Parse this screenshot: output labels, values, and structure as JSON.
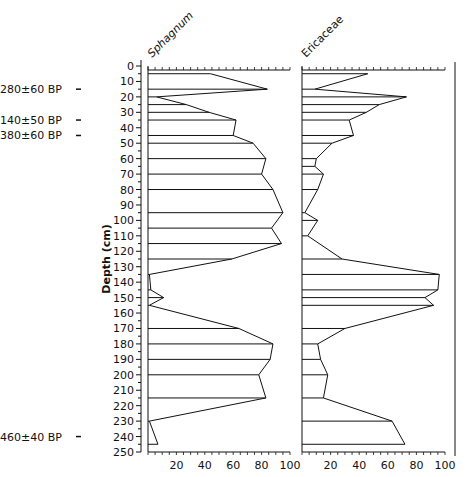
{
  "chart_data": {
    "type": "area",
    "subtype": "pollen-stratigraphic-diagram",
    "ylabel": "Depth (cm)",
    "ylim": [
      0,
      250
    ],
    "yticks": [
      0,
      10,
      20,
      30,
      40,
      50,
      60,
      70,
      80,
      90,
      100,
      110,
      120,
      130,
      140,
      150,
      160,
      170,
      180,
      190,
      200,
      210,
      220,
      230,
      240,
      250
    ],
    "xticks": [
      20,
      40,
      60,
      80,
      100
    ],
    "xlim": [
      0,
      100
    ],
    "dates": [
      {
        "label": "280±60 BP",
        "depth": 15
      },
      {
        "label": "2140±50 BP",
        "depth": 35
      },
      {
        "label": "2380±60 BP",
        "depth": 45
      },
      {
        "label": "4460±40 BP",
        "depth": 240
      }
    ],
    "series": [
      {
        "name": "Sphagnum",
        "depths": [
          5,
          15,
          20,
          25,
          30,
          35,
          45,
          50,
          60,
          70,
          80,
          95,
          105,
          115,
          125,
          135,
          145,
          150,
          155,
          170,
          180,
          190,
          200,
          215,
          230,
          245
        ],
        "values": [
          44,
          84,
          6,
          27,
          43,
          62,
          60,
          74,
          83,
          80,
          88,
          95,
          87,
          94,
          59,
          1,
          2,
          11,
          1,
          64,
          88,
          86,
          78,
          83,
          1,
          7
        ]
      },
      {
        "name": "Ericaceae",
        "depths": [
          5,
          15,
          20,
          25,
          30,
          35,
          45,
          50,
          60,
          65,
          70,
          80,
          95,
          100,
          110,
          125,
          135,
          145,
          150,
          155,
          170,
          180,
          190,
          200,
          215,
          230,
          245
        ],
        "values": [
          46,
          9,
          73,
          54,
          45,
          33,
          36,
          21,
          10,
          9,
          15,
          11,
          2,
          11,
          4,
          28,
          96,
          95,
          86,
          92,
          30,
          11,
          13,
          18,
          15,
          63,
          72
        ]
      }
    ]
  }
}
